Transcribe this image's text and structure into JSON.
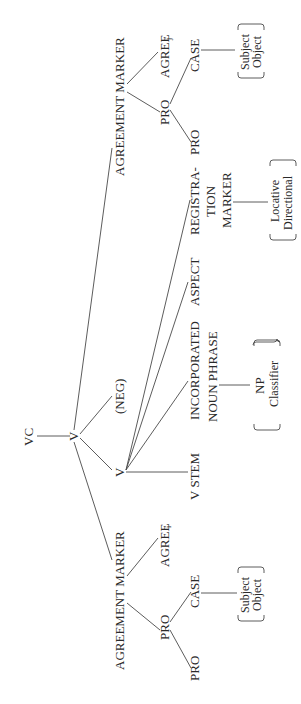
{
  "diagram": {
    "type": "syntactic-tree",
    "orientation": "rotated-90-ccw",
    "nodes": {
      "root": "VC",
      "v_top": "V",
      "neg": "(NEG)",
      "v_inner": "V",
      "v_stem": "V STEM",
      "inc_np_line1": "INCORPORATED",
      "inc_np_line2": "NOUN PHRASE",
      "np_option1": "NP",
      "np_option2": "Classifier",
      "aspect": "ASPECT",
      "reg_line1": "REGISTRA-",
      "reg_line2": "TION",
      "reg_line3": "MARKER",
      "reg_option1": "Locative",
      "reg_option2": "Directional",
      "agr_top": "AGREEMENT MARKER",
      "agree_top": "AGREE",
      "agree_top_sub": "j",
      "pro_top_parent": "PRO",
      "pro_top_child": "PRO",
      "case_top": "CASE",
      "case_top_option1": "Subject",
      "case_top_option2": "Object",
      "agr_bottom": "AGREEMENT MARKER",
      "agree_bottom": "AGREE",
      "agree_bottom_sub": "i",
      "pro_bottom_parent": "PRO",
      "pro_bottom_child": "PRO",
      "case_bottom": "CASE",
      "case_bottom_option1": "Subject",
      "case_bottom_option2": "Object"
    },
    "colors": {
      "background": "#ffffff",
      "ink": "#2a2a2a"
    }
  }
}
